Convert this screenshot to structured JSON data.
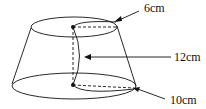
{
  "diagram": {
    "type": "frustum-of-cone",
    "labels": {
      "top_radius": "6cm",
      "height": "12cm",
      "bottom_radius": "10cm"
    },
    "colors": {
      "stroke": "#111111",
      "background": "#ffffff"
    }
  }
}
